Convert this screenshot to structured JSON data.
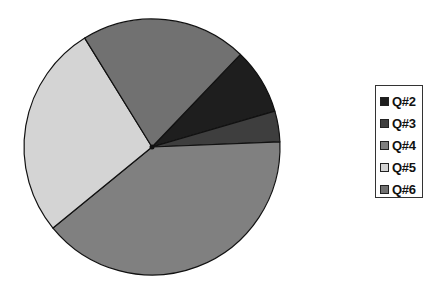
{
  "chart_data": {
    "type": "pie",
    "title": "",
    "categories": [
      "Q#2",
      "Q#3",
      "Q#4",
      "Q#5",
      "Q#6"
    ],
    "values": [
      8.3,
      3.9,
      39.7,
      27.1,
      20.9
    ],
    "unit": "percent (estimated from slice angles)",
    "colors": {
      "Q#2": "#1e1e1e",
      "Q#3": "#3e3e3e",
      "Q#4": "#808080",
      "Q#5": "#d4d4d4",
      "Q#6": "#717171"
    },
    "slice_angles_deg_clockwise_from_top": {
      "Q#6": [
        328.3,
        43.7
      ],
      "Q#2": [
        43.7,
        73.7
      ],
      "Q#3": [
        73.7,
        87.7
      ],
      "Q#4": [
        87.7,
        230.7
      ],
      "Q#5": [
        230.7,
        328.3
      ]
    },
    "legend_position": "right",
    "grid": false,
    "data_labels": false
  },
  "legend": {
    "items": [
      {
        "label": "Q#2",
        "color": "#1e1e1e"
      },
      {
        "label": "Q#3",
        "color": "#3e3e3e"
      },
      {
        "label": "Q#4",
        "color": "#808080"
      },
      {
        "label": "Q#5",
        "color": "#d4d4d4"
      },
      {
        "label": "Q#6",
        "color": "#717171"
      }
    ]
  }
}
